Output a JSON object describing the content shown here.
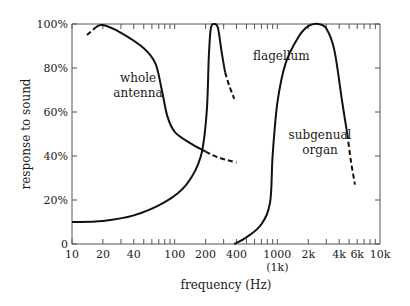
{
  "chart_data": {
    "type": "line",
    "title": "",
    "xlabel": "frequency (Hz)",
    "ylabel": "response to sound",
    "xscale": "log",
    "xlim": [
      10,
      10000
    ],
    "ylim": [
      0,
      100
    ],
    "grid": false,
    "legend": "none (inline annotations)",
    "x_tick_labels": [
      {
        "value": 10,
        "label": "10"
      },
      {
        "value": 20,
        "label": "20"
      },
      {
        "value": 40,
        "label": "40"
      },
      {
        "value": 100,
        "label": "100"
      },
      {
        "value": 200,
        "label": "200"
      },
      {
        "value": 400,
        "label": "400"
      },
      {
        "value": 1000,
        "label": "1000",
        "sublabel": "(1k)"
      },
      {
        "value": 2000,
        "label": "2k"
      },
      {
        "value": 4000,
        "label": "4k"
      },
      {
        "value": 6000,
        "label": "6k"
      },
      {
        "value": 10000,
        "label": "10k"
      }
    ],
    "y_tick_labels": [
      {
        "value": 0,
        "label": "0"
      },
      {
        "value": 20,
        "label": "20%"
      },
      {
        "value": 40,
        "label": "40%"
      },
      {
        "value": 60,
        "label": "60%"
      },
      {
        "value": 80,
        "label": "80%"
      },
      {
        "value": 100,
        "label": "100%"
      }
    ],
    "series": [
      {
        "name": "whole antenna",
        "label_position": {
          "x": 55,
          "y": 75
        },
        "points": [
          {
            "x": 14,
            "y": 95,
            "style": "dashed"
          },
          {
            "x": 17,
            "y": 98.5,
            "style": "dashed"
          },
          {
            "x": 20,
            "y": 99.5,
            "style": "solid"
          },
          {
            "x": 30,
            "y": 96
          },
          {
            "x": 50,
            "y": 89
          },
          {
            "x": 65,
            "y": 82
          },
          {
            "x": 75,
            "y": 70
          },
          {
            "x": 85,
            "y": 58
          },
          {
            "x": 100,
            "y": 51
          },
          {
            "x": 140,
            "y": 46
          },
          {
            "x": 200,
            "y": 42
          },
          {
            "x": 260,
            "y": 39.5,
            "style": "dashed"
          },
          {
            "x": 400,
            "y": 37,
            "style": "dashed"
          }
        ]
      },
      {
        "name": "flagellum",
        "label_position": {
          "x": 340,
          "y": 88
        },
        "points": [
          {
            "x": 10,
            "y": 10
          },
          {
            "x": 20,
            "y": 10.5
          },
          {
            "x": 40,
            "y": 13
          },
          {
            "x": 80,
            "y": 19
          },
          {
            "x": 130,
            "y": 27
          },
          {
            "x": 180,
            "y": 40
          },
          {
            "x": 205,
            "y": 60
          },
          {
            "x": 215,
            "y": 85
          },
          {
            "x": 225,
            "y": 98
          },
          {
            "x": 245,
            "y": 100
          },
          {
            "x": 265,
            "y": 98
          },
          {
            "x": 285,
            "y": 88
          },
          {
            "x": 310,
            "y": 78
          },
          {
            "x": 340,
            "y": 72,
            "style": "dashed"
          },
          {
            "x": 380,
            "y": 66,
            "style": "dashed"
          }
        ]
      },
      {
        "name": "subgenual organ",
        "label_position": {
          "x": 1800,
          "y": 42
        },
        "points": [
          {
            "x": 380,
            "y": 0
          },
          {
            "x": 500,
            "y": 3
          },
          {
            "x": 700,
            "y": 9
          },
          {
            "x": 850,
            "y": 19
          },
          {
            "x": 900,
            "y": 40
          },
          {
            "x": 1000,
            "y": 64
          },
          {
            "x": 1200,
            "y": 82
          },
          {
            "x": 1600,
            "y": 94
          },
          {
            "x": 2000,
            "y": 99
          },
          {
            "x": 2500,
            "y": 100
          },
          {
            "x": 3000,
            "y": 98
          },
          {
            "x": 3600,
            "y": 88
          },
          {
            "x": 4300,
            "y": 64
          },
          {
            "x": 4800,
            "y": 50
          },
          {
            "x": 5200,
            "y": 38,
            "style": "dashed"
          },
          {
            "x": 5700,
            "y": 27,
            "style": "dashed"
          }
        ]
      }
    ]
  },
  "labels": {
    "xlabel": "frequency (Hz)",
    "ylabel": "response to sound",
    "whole_antenna_1": "whole",
    "whole_antenna_2": "antenna",
    "flagellum": "flagellum",
    "subgenual_1": "subgenual",
    "subgenual_2": "organ"
  }
}
